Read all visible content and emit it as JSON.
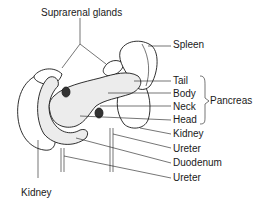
{
  "figure": {
    "labels": {
      "suprarenal_glands": "Suprarenal glands",
      "spleen": "Spleen",
      "tail": "Tail",
      "body": "Body",
      "neck": "Neck",
      "head": "Head",
      "pancreas": "Pancreas",
      "kidney_right": "Kidney",
      "ureter_upper": "Ureter",
      "duodenum": "Duodenum",
      "ureter_lower": "Ureter",
      "kidney_left": "Kidney"
    }
  }
}
